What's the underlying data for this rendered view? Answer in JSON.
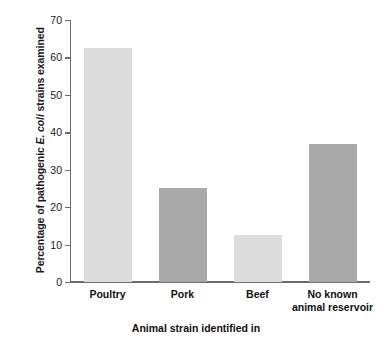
{
  "chart_data": {
    "type": "bar",
    "title": "",
    "xlabel": "Animal strain identified in",
    "ylabel_html": "Percentage of pathogenic <i>E. coli</i> strains examined",
    "ylabel_text": "Percentage of pathogenic E. coli strains examined",
    "categories": [
      "Poultry",
      "Pork",
      "Beef",
      "No known animal reservoir"
    ],
    "category_lines": [
      [
        "Poultry"
      ],
      [
        "Pork"
      ],
      [
        "Beef"
      ],
      [
        "No known",
        "animal reservoir"
      ]
    ],
    "values": [
      62.5,
      25,
      12.5,
      37
    ],
    "bar_colors": [
      "#dcdcdc",
      "#a9a9a9",
      "#dcdcdc",
      "#a9a9a9"
    ],
    "ylim": [
      0,
      70
    ],
    "yticks": [
      0,
      10,
      20,
      30,
      40,
      50,
      60,
      70
    ],
    "ytick_labels": [
      "0",
      "10",
      "20",
      "30",
      "40",
      "50",
      "60",
      "70"
    ],
    "grid": false,
    "legend": null,
    "axis_color": "#6d6d6d"
  }
}
